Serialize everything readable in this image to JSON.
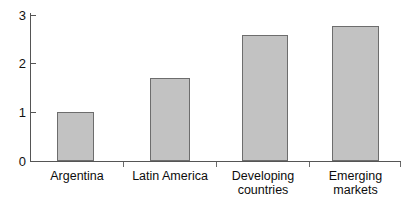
{
  "chart_data": {
    "type": "bar",
    "title": "",
    "subtitle": "",
    "xlabel": "",
    "ylabel": "",
    "categories": [
      "Argentina",
      "Latin America",
      "Developing countries",
      "Emerging markets"
    ],
    "values": [
      1.0,
      1.7,
      2.58,
      2.78
    ],
    "series": [
      {
        "name": "",
        "values": [
          1.0,
          1.7,
          2.58,
          2.78
        ]
      }
    ],
    "ylim": [
      0,
      3
    ],
    "yticks": [
      0,
      1,
      2,
      3
    ],
    "ytick_labels": [
      "0",
      "1",
      "2",
      "3"
    ],
    "grid": false,
    "legend": false,
    "legend_position": "none",
    "bar_color": "#c2c2c2",
    "bar_edge_color": "#6d6d6d",
    "axis_color": "#555555",
    "background_color": "#ffffff",
    "text_color": "#0d0d0d"
  },
  "axis": {
    "y_ticks": [
      {
        "label": "3",
        "value": 3
      },
      {
        "label": "2",
        "value": 2
      },
      {
        "label": "1",
        "value": 1
      },
      {
        "label": "0",
        "value": 0
      }
    ]
  },
  "bars": [
    {
      "category": "Argentina",
      "label": "Argentina",
      "value": 1.0
    },
    {
      "category": "Latin America",
      "label": "Latin America",
      "value": 1.7
    },
    {
      "category": "Developing countries",
      "label": "Developing\ncountries",
      "value": 2.58
    },
    {
      "category": "Emerging markets",
      "label": "Emerging\nmarkets",
      "value": 2.78
    }
  ]
}
